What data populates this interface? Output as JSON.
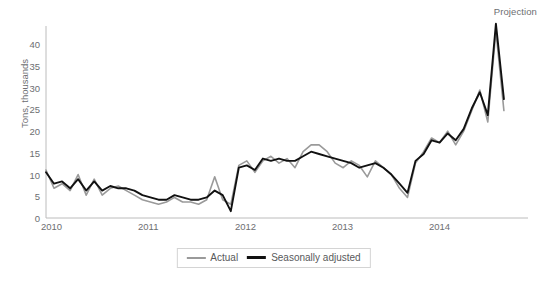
{
  "annotation": {
    "projection": "Projection"
  },
  "axes": {
    "ylabel": "Tons, thousands",
    "yticks": [
      "0",
      "5",
      "10",
      "15",
      "20",
      "25",
      "30",
      "35",
      "40"
    ],
    "xticks": [
      "2010",
      "2011",
      "2012",
      "2013",
      "2014"
    ]
  },
  "legend": {
    "items": [
      {
        "label": "Actual",
        "color": "#9a9a9a"
      },
      {
        "label": "Seasonally adjusted",
        "color": "#111111"
      }
    ]
  },
  "colors": {
    "actual": "#9a9a9a",
    "adjusted": "#111111",
    "axis": "#bcbcbc",
    "text": "#6d6e71"
  },
  "chart_data": {
    "type": "line",
    "title": "",
    "subtitle": "",
    "xlabel": "",
    "ylabel": "Tons, thousands",
    "ylim": [
      0,
      42
    ],
    "xlim": [
      2010.0,
      2015.0
    ],
    "yticks": [
      0,
      5,
      10,
      15,
      20,
      25,
      30,
      35,
      40
    ],
    "xticks": [
      2010,
      2011,
      2012,
      2013,
      2014
    ],
    "grid": false,
    "legend_position": "bottom-center",
    "annotations": [
      {
        "text": "Projection",
        "position": "top-right"
      }
    ],
    "x": [
      2010.0,
      2010.083,
      2010.167,
      2010.25,
      2010.333,
      2010.417,
      2010.5,
      2010.583,
      2010.667,
      2010.75,
      2010.833,
      2010.917,
      2011.0,
      2011.083,
      2011.167,
      2011.25,
      2011.333,
      2011.417,
      2011.5,
      2011.583,
      2011.667,
      2011.75,
      2011.833,
      2011.917,
      2012.0,
      2012.083,
      2012.167,
      2012.25,
      2012.333,
      2012.417,
      2012.5,
      2012.583,
      2012.667,
      2012.75,
      2012.833,
      2012.917,
      2013.0,
      2013.083,
      2013.167,
      2013.25,
      2013.333,
      2013.417,
      2013.5,
      2013.583,
      2013.667,
      2013.75,
      2013.833,
      2013.917,
      2014.0,
      2014.083,
      2014.167,
      2014.25,
      2014.333,
      2014.417,
      2014.5,
      2014.583,
      2014.667,
      2014.75
    ],
    "series": [
      {
        "name": "Actual",
        "color": "#9a9a9a",
        "values": [
          10.5,
          6.5,
          7.5,
          6.0,
          9.5,
          5.0,
          8.5,
          5.0,
          6.5,
          7.0,
          6.0,
          5.0,
          4.0,
          3.5,
          3.0,
          3.5,
          4.5,
          3.5,
          3.5,
          3.0,
          4.0,
          9.0,
          4.0,
          3.0,
          11.5,
          12.5,
          10.0,
          12.5,
          13.5,
          12.0,
          13.0,
          11.0,
          14.5,
          16.0,
          16.0,
          14.5,
          12.0,
          11.0,
          12.5,
          11.5,
          9.0,
          12.5,
          11.0,
          9.5,
          6.5,
          4.5,
          12.0,
          14.5,
          17.5,
          16.5,
          19.0,
          16.0,
          19.0,
          23.5,
          28.0,
          21.0,
          41.0,
          23.5
        ]
      },
      {
        "name": "Seasonally adjusted",
        "color": "#111111",
        "values": [
          10.0,
          7.5,
          8.0,
          6.5,
          8.5,
          6.0,
          8.0,
          6.0,
          7.0,
          6.5,
          6.5,
          6.0,
          5.0,
          4.5,
          4.0,
          4.0,
          5.0,
          4.5,
          4.0,
          4.0,
          4.5,
          6.0,
          5.0,
          1.5,
          11.0,
          11.5,
          10.5,
          13.0,
          12.5,
          13.0,
          12.5,
          12.5,
          13.5,
          14.5,
          14.0,
          13.5,
          13.0,
          12.5,
          12.0,
          11.0,
          11.5,
          12.0,
          11.0,
          9.5,
          7.5,
          5.5,
          12.5,
          14.0,
          17.0,
          16.5,
          18.5,
          17.0,
          19.5,
          24.0,
          27.5,
          22.5,
          42.5,
          26.0
        ]
      }
    ],
    "note": "Monthly series January 2010 through late 2014 with projection segment at right; second half of 2014 values are projected."
  }
}
